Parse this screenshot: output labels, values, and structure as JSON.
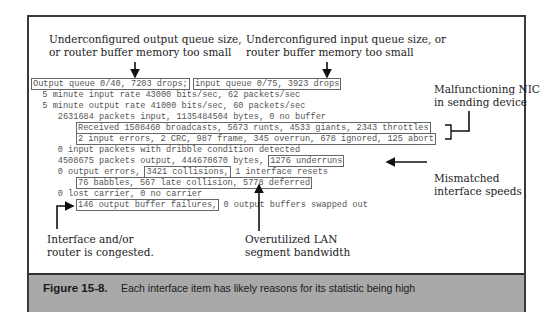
{
  "annotations": {
    "output_queue": {
      "line1": "Underconfigured output queue size,",
      "line2": "or router buffer memory too small"
    },
    "input_queue": {
      "line1": "Underconfigured input queue size, or",
      "line2": "router buffer memory too small"
    },
    "nic": {
      "line1": "Malfunctioning NIC",
      "line2": "in sending device"
    },
    "speeds": {
      "line1": "Mismatched",
      "line2": "interface speeds"
    },
    "congested": {
      "line1": "Interface and/or",
      "line2": "router is congested."
    },
    "lan": {
      "line1": "Overutilized LAN",
      "line2": "segment bandwidth"
    }
  },
  "output": {
    "l1a": "Output queue 0/40, 7203 drops;",
    "l1b": "input queue 0/75, 3923 drops",
    "l2": "  5 minute input rate 43000 bits/sec, 62 packets/sec",
    "l3": "  5 minute output rate 41000 bits/sec, 60 packets/sec",
    "l4": "     2631684 packets input, 1135484504 bytes, 0 no buffer",
    "l5": "Received 1508460 broadcasts, 5673 runts, 4533 giants, 2343 throttles",
    "l6": "2 input errors, 2 CRC, 987 frame, 345 overrun, 678 ignored, 125 abort",
    "l7": "     0 input packets with dribble condition detected",
    "l8a": "     4508675 packets output, 444670670 bytes, ",
    "l8b": "1276 underruns",
    "l9a": "     0 output errors, ",
    "l9b": "3421 collisions,",
    "l9c": " 1 interface resets",
    "l10": "76 babbles, 567 late collision, 5778 deferred",
    "l11": "     0 lost carrier, 0 no carrier",
    "l12a": "146 output buffer failures,",
    "l12b": " 0 output buffers swapped out"
  },
  "caption": {
    "label": "Figure 15-8.",
    "text": "Each interface item has likely reasons for its statistic being high"
  },
  "colors": {
    "caption_band": "#a9a9a9",
    "frame": "#3a3a3a"
  }
}
